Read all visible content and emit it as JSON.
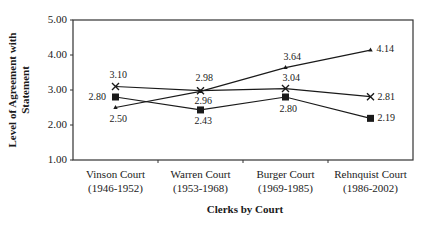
{
  "chart_data": {
    "type": "line",
    "title": "",
    "xlabel": "Clerks by Court",
    "ylabel": "Level of Agreement with Statement",
    "ylabel_lines": [
      "Level of Agreement with",
      "Statement"
    ],
    "categories": [
      "Vinson Court (1946-1952)",
      "Warren Court (1953-1968)",
      "Burger Court (1969-1985)",
      "Rehnquist Court (1986-2002)"
    ],
    "category_lines": [
      [
        "Vinson Court",
        "(1946-1952)"
      ],
      [
        "Warren Court",
        "(1953-1968)"
      ],
      [
        "Burger Court",
        "(1969-1985)"
      ],
      [
        "Rehnquist Court",
        "(1986-2002)"
      ]
    ],
    "ylim": [
      1.0,
      5.0
    ],
    "yticks": [
      "5.00",
      "4.00",
      "3.00",
      "2.00",
      "1.00"
    ],
    "grid": false,
    "legend": null,
    "series": [
      {
        "name": "x-marker series",
        "marker": "x",
        "values": [
          3.1,
          2.98,
          3.04,
          2.81
        ],
        "labels": [
          "3.10",
          "2.98",
          "3.04",
          "2.81"
        ]
      },
      {
        "name": "square-marker series",
        "marker": "square",
        "values": [
          2.8,
          2.43,
          2.8,
          2.19
        ],
        "labels": [
          "2.80",
          "2.43",
          "2.80",
          "2.19"
        ]
      },
      {
        "name": "triangle-marker series",
        "marker": "triangle",
        "values": [
          2.5,
          2.96,
          3.64,
          4.14
        ],
        "labels": [
          "2.50",
          "2.96",
          "3.64",
          "4.14"
        ]
      }
    ]
  },
  "colors": {
    "line": "#1a1a1a",
    "axis": "#333333",
    "background": "#ffffff"
  }
}
